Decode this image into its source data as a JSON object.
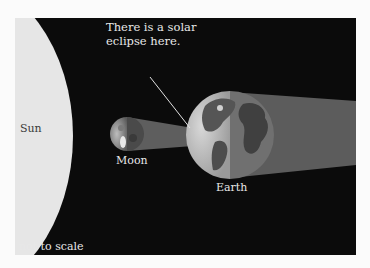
{
  "diagram": {
    "labels": {
      "sun": "Sun",
      "moon": "Moon",
      "earth": "Earth",
      "annotation_line1": "There is a solar",
      "annotation_line2": "eclipse here.",
      "scale_note": "not to scale"
    },
    "colors": {
      "background": "#0b0b0b",
      "page": "#fbfbfb",
      "sun": "#e6e6e6",
      "shadow": "#5a5a5a",
      "text": "#e8e8e8"
    }
  }
}
